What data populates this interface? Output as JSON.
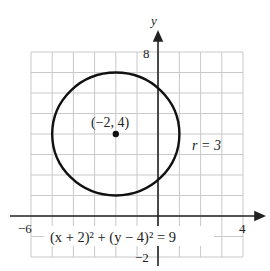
{
  "chart_data": {
    "type": "line",
    "title": "",
    "xlabel": "x",
    "ylabel": "y",
    "xlim": [
      -6,
      4
    ],
    "ylim": [
      -2,
      8
    ],
    "grid": true,
    "tick_labels": {
      "x_min": "−6",
      "x_max": "4",
      "y_min": "−2",
      "y_max": "8"
    },
    "series": [
      {
        "name": "circle",
        "shape": "circle",
        "center": [
          -2,
          4
        ],
        "radius": 3
      }
    ],
    "annotations": {
      "center_label": "(−2, 4)",
      "radius_label": "r = 3",
      "equation": "(x + 2)² + (y − 4)² = 9"
    }
  }
}
